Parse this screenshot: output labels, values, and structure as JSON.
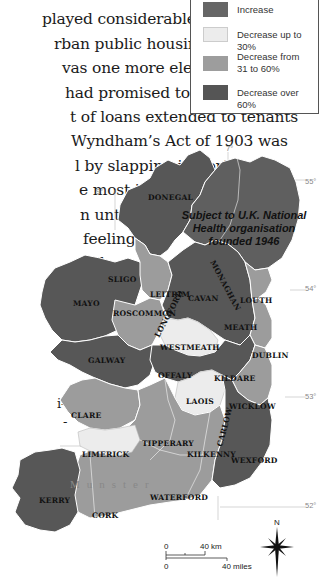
{
  "body_text": {
    "lines": [
      "played considerable energy in",
      "rban public housing. But the",
      "vas one more election promise",
      " had promised to withhold the",
      "t of loans extended to tenants",
      "Wyndham’s Act of 1903 was",
      "l by slapping import",
      "e most impor-",
      "n until 1938,",
      " feeling the",
      "all",
      "i-",
      "-"
    ]
  },
  "legend": {
    "items": [
      {
        "label": "Increase",
        "color": "#666666"
      },
      {
        "label": "Decrease up to 30%",
        "color": "#ececec"
      },
      {
        "label": "Decrease from\n31 to 60%",
        "label_line1": "Decrease from",
        "label_line2": "31 to 60%",
        "color": "#9d9d9d"
      },
      {
        "label": "Decrease over 60%",
        "color": "#555555"
      }
    ]
  },
  "map": {
    "colors": {
      "over60": "#575757",
      "mid": "#9c9c9c",
      "light": "#ececec",
      "ni": "#5f5f5f",
      "sea": "#ffffff",
      "border": "#ffffff"
    },
    "northern_ireland_note": [
      "Subject to U.K. National",
      "Health organisation",
      "founded 1946"
    ],
    "province_label": "Munster",
    "counties": [
      {
        "name": "DONEGAL"
      },
      {
        "name": "SLIGO"
      },
      {
        "name": "LEITRIM"
      },
      {
        "name": "CAVAN"
      },
      {
        "name": "MONAGHAN"
      },
      {
        "name": "LOUTH"
      },
      {
        "name": "MAYO"
      },
      {
        "name": "ROSCOMMON"
      },
      {
        "name": "LONGFORD"
      },
      {
        "name": "MEATH"
      },
      {
        "name": "WESTMEATH"
      },
      {
        "name": "DUBLIN"
      },
      {
        "name": "GALWAY"
      },
      {
        "name": "OFFALY"
      },
      {
        "name": "KILDARE"
      },
      {
        "name": "LAOIS"
      },
      {
        "name": "WICKLOW"
      },
      {
        "name": "CLARE"
      },
      {
        "name": "TIPPERARY"
      },
      {
        "name": "CARLOW"
      },
      {
        "name": "LIMERICK"
      },
      {
        "name": "KILKENNY"
      },
      {
        "name": "WEXFORD"
      },
      {
        "name": "KERRY"
      },
      {
        "name": "WATERFORD"
      },
      {
        "name": "CORK"
      }
    ],
    "coordinates": {
      "lon_7": "7°",
      "lon_9": "9°",
      "lat_55": "55°",
      "lat_54": "54°",
      "lat_53": "53°",
      "lat_52": "52°"
    },
    "scale": {
      "zero_km": "0",
      "km_label": "40 km",
      "zero_mi": "0",
      "mi_label": "40 miles"
    },
    "compass": {
      "north": "N"
    }
  }
}
